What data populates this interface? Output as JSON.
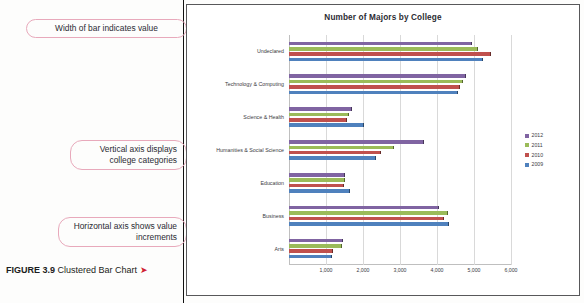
{
  "figure": {
    "label": "FIGURE 3.9",
    "title": "Clustered Bar Chart",
    "arrow_glyph": "➤"
  },
  "annotations": [
    {
      "text": "Width of bar indicates value"
    },
    {
      "text": "Vertical axis displays college categories"
    },
    {
      "text": "Horizontal axis shows value increments"
    }
  ],
  "chart_data": {
    "type": "bar",
    "orientation": "horizontal",
    "title": "Number of Majors by College",
    "xlabel": "",
    "ylabel": "",
    "xlim": [
      0,
      6000
    ],
    "xticks": [
      "0",
      "1,000",
      "2,000",
      "3,000",
      "4,000",
      "5,000",
      "6,000"
    ],
    "xtick_values": [
      0,
      1000,
      2000,
      3000,
      4000,
      5000,
      6000
    ],
    "grid": true,
    "legend_position": "right",
    "categories": [
      "Undeclared",
      "Technology & Computing",
      "Science & Health",
      "Humanities & Social Science",
      "Education",
      "Business",
      "Arts"
    ],
    "series": [
      {
        "name": "2012",
        "color": "#8064a2",
        "values": [
          4950,
          4780,
          1700,
          3650,
          1520,
          4050,
          1450
        ]
      },
      {
        "name": "2011",
        "color": "#9bbb59",
        "values": [
          5120,
          4700,
          1620,
          2850,
          1500,
          4300,
          1430
        ]
      },
      {
        "name": "2010",
        "color": "#c0504d",
        "values": [
          5450,
          4620,
          1560,
          2480,
          1490,
          4200,
          1200
        ]
      },
      {
        "name": "2009",
        "color": "#4f81bd",
        "values": [
          5250,
          4560,
          2020,
          2340,
          1660,
          4330,
          1150
        ]
      }
    ]
  }
}
